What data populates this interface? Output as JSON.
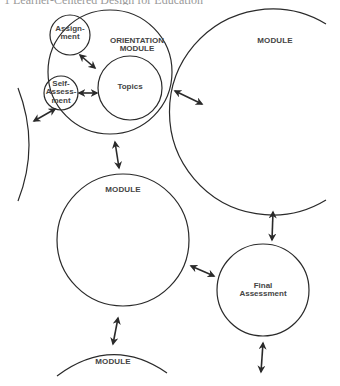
{
  "caption": "1 Learner-Centered Design for Education",
  "colors": {
    "stroke": "#2a2a2a",
    "text": "#444444",
    "background": "#ffffff"
  },
  "diagram": {
    "orientation_module": {
      "label_line1": "ORIENTATION",
      "label_line2": "MODULE",
      "assignment": {
        "line1": "Assign-",
        "line2": "ment"
      },
      "topics": {
        "label": "Topics"
      },
      "self_assessment": {
        "line1": "Self-",
        "line2": "Assess-",
        "line3": "ment"
      }
    },
    "module_right": {
      "label": "MODULE"
    },
    "module_middle": {
      "label": "MODULE"
    },
    "module_bottom": {
      "label": "MODULE"
    },
    "final_assessment": {
      "line1": "Final",
      "line2": "Assessment"
    },
    "connectors": [
      {
        "from": "orientation_module",
        "to": "module_left",
        "type": "bidirectional-arrow"
      },
      {
        "from": "orientation_module",
        "to": "module_right",
        "type": "bidirectional-arrow"
      },
      {
        "from": "orientation_module",
        "to": "module_middle",
        "type": "bidirectional-arrow"
      },
      {
        "from": "module_right",
        "to": "final_assessment",
        "type": "bidirectional-arrow"
      },
      {
        "from": "module_middle",
        "to": "final_assessment",
        "type": "bidirectional-arrow"
      },
      {
        "from": "module_middle",
        "to": "module_bottom",
        "type": "bidirectional-arrow"
      },
      {
        "from": "final_assessment",
        "to": "offscreen-below",
        "type": "bidirectional-arrow"
      },
      {
        "from": "assignment",
        "to": "topics",
        "type": "bidirectional-arrow"
      },
      {
        "from": "self_assessment",
        "to": "topics",
        "type": "bidirectional-arrow"
      }
    ]
  }
}
